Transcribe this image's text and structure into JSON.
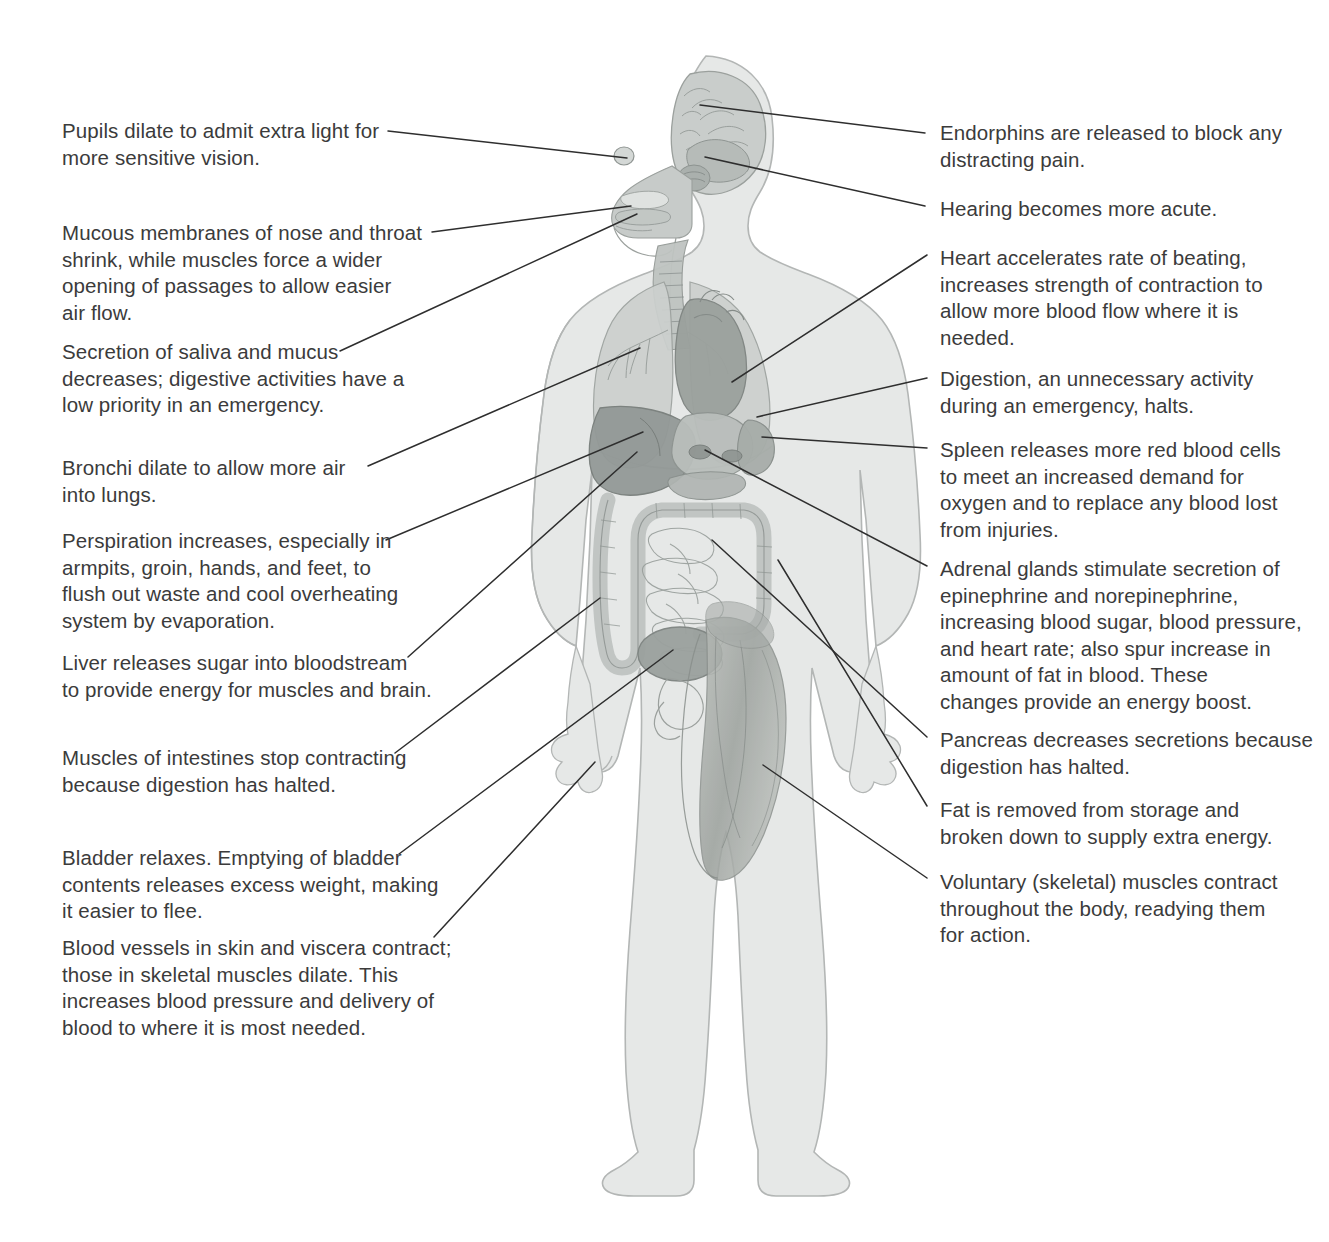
{
  "figure": {
    "view": "anterior full-body silhouette with internal organs",
    "organs": [
      "brain",
      "pupils",
      "nasal passages",
      "mouth",
      "salivary glands",
      "trachea",
      "bronchi",
      "lungs",
      "heart",
      "liver",
      "stomach",
      "spleen",
      "pancreas",
      "adrenal glands",
      "small intestine",
      "large intestine",
      "bladder",
      "skeletal muscles",
      "fat stores"
    ],
    "colors": {
      "background": "#ffffff",
      "text": "#3b3b3b",
      "leader_line": "#2e2e2e",
      "body_fill": "#e3e5e4",
      "body_outline": "#b9bcbb",
      "organ_light": "#cfd2d1",
      "organ_mid": "#b6bab8",
      "organ_dark": "#9aa09d",
      "muscle": "#a9aeaa"
    }
  },
  "left_callouts": [
    {
      "id": "pupils",
      "text": "Pupils dilate to admit extra light for\nmore sensitive vision.",
      "x": 62,
      "y": 118,
      "width": 355,
      "leader": {
        "from_x": 388,
        "from_y": 131,
        "to_x": 627,
        "to_y": 158
      }
    },
    {
      "id": "mucous-membranes",
      "text": "Mucous membranes of nose and throat\nshrink, while muscles force a wider\nopening of passages to allow easier\nair flow.",
      "x": 62,
      "y": 220,
      "width": 390,
      "leader": {
        "from_x": 432,
        "from_y": 232,
        "to_x": 631,
        "to_y": 206
      }
    },
    {
      "id": "saliva-mucus",
      "text": "Secretion of saliva and mucus\ndecreases; digestive activities have a\nlow priority in an emergency.",
      "x": 62,
      "y": 339,
      "width": 390,
      "leader": {
        "from_x": 340,
        "from_y": 351,
        "to_x": 637,
        "to_y": 214
      }
    },
    {
      "id": "bronchi",
      "text": "Bronchi dilate to allow more air\ninto lungs.",
      "x": 62,
      "y": 455,
      "width": 355,
      "leader": {
        "from_x": 368,
        "from_y": 466,
        "to_x": 640,
        "to_y": 348
      }
    },
    {
      "id": "perspiration",
      "text": "Perspiration increases, especially in\narmpits, groin, hands, and feet, to\nflush out waste and cool overheating\nsystem by evaporation.",
      "x": 62,
      "y": 528,
      "width": 390,
      "leader": {
        "from_x": 386,
        "from_y": 540,
        "to_x": 643,
        "to_y": 432
      }
    },
    {
      "id": "liver",
      "text": "Liver releases sugar into bloodstream\nto provide energy for muscles and brain.",
      "x": 62,
      "y": 650,
      "width": 400,
      "leader": {
        "from_x": 408,
        "from_y": 657,
        "to_x": 637,
        "to_y": 452
      }
    },
    {
      "id": "intestines",
      "text": "Muscles of intestines stop contracting\nbecause digestion has halted.",
      "x": 62,
      "y": 745,
      "width": 395,
      "leader": {
        "from_x": 395,
        "from_y": 753,
        "to_x": 600,
        "to_y": 598
      }
    },
    {
      "id": "bladder",
      "text": "Bladder relaxes. Emptying of bladder\ncontents releases excess weight, making\nit easier to flee.",
      "x": 62,
      "y": 845,
      "width": 400,
      "leader": {
        "from_x": 399,
        "from_y": 854,
        "to_x": 673,
        "to_y": 650
      }
    },
    {
      "id": "blood-vessels",
      "text": "Blood vessels in skin and viscera contract;\nthose in skeletal muscles dilate. This\nincreases blood pressure and delivery of\nblood to where it is most needed.",
      "x": 62,
      "y": 935,
      "width": 410,
      "leader": {
        "from_x": 434,
        "from_y": 937,
        "to_x": 595,
        "to_y": 762
      }
    }
  ],
  "right_callouts": [
    {
      "id": "endorphins",
      "text": "Endorphins are released to block any\ndistracting pain.",
      "x": 940,
      "y": 120,
      "width": 360,
      "leader": {
        "from_x": 925,
        "from_y": 133,
        "to_x": 700,
        "to_y": 105
      }
    },
    {
      "id": "hearing",
      "text": "Hearing becomes more acute.",
      "x": 940,
      "y": 196,
      "width": 360,
      "leader": {
        "from_x": 925,
        "from_y": 206,
        "to_x": 705,
        "to_y": 157
      }
    },
    {
      "id": "heart",
      "text": "Heart accelerates rate of beating,\nincreases strength of contraction to\nallow more blood flow where it is\nneeded.",
      "x": 940,
      "y": 245,
      "width": 370,
      "leader": {
        "from_x": 927,
        "from_y": 255,
        "to_x": 732,
        "to_y": 382
      }
    },
    {
      "id": "digestion",
      "text": "Digestion, an unnecessary activity\nduring an emergency, halts.",
      "x": 940,
      "y": 366,
      "width": 370,
      "leader": {
        "from_x": 927,
        "from_y": 378,
        "to_x": 757,
        "to_y": 417
      }
    },
    {
      "id": "spleen",
      "text": "Spleen releases more red blood cells\nto meet an increased demand for\noxygen and to replace any blood lost\nfrom injuries.",
      "x": 940,
      "y": 437,
      "width": 375,
      "leader": {
        "from_x": 927,
        "from_y": 448,
        "to_x": 762,
        "to_y": 437
      }
    },
    {
      "id": "adrenal",
      "text": "Adrenal glands stimulate secretion of\nepinephrine and norepinephrine,\nincreasing blood sugar, blood pressure,\nand heart rate; also spur increase in\namount of fat in blood. These\nchanges provide an energy boost.",
      "x": 940,
      "y": 556,
      "width": 385,
      "leader": {
        "from_x": 927,
        "from_y": 566,
        "to_x": 705,
        "to_y": 450
      }
    },
    {
      "id": "pancreas",
      "text": "Pancreas decreases secretions because\ndigestion has halted.",
      "x": 940,
      "y": 727,
      "width": 380,
      "leader": {
        "from_x": 927,
        "from_y": 737,
        "to_x": 712,
        "to_y": 540
      }
    },
    {
      "id": "fat",
      "text": "Fat is removed from storage and\nbroken down to supply extra energy.",
      "x": 940,
      "y": 797,
      "width": 375,
      "leader": {
        "from_x": 927,
        "from_y": 806,
        "to_x": 778,
        "to_y": 560
      }
    },
    {
      "id": "voluntary-muscles",
      "text": "Voluntary (skeletal) muscles contract\nthroughout the body, readying them\nfor action.",
      "x": 940,
      "y": 869,
      "width": 375,
      "leader": {
        "from_x": 927,
        "from_y": 878,
        "to_x": 763,
        "to_y": 765
      }
    }
  ]
}
